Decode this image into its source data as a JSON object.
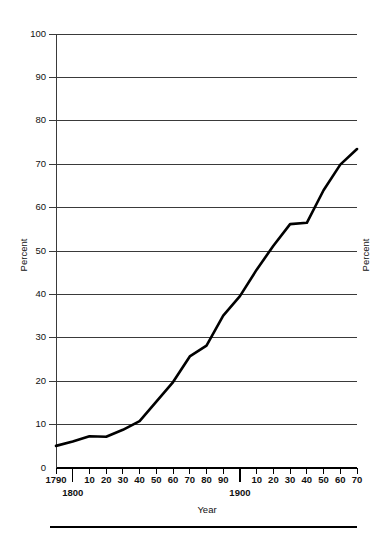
{
  "chart_data": {
    "type": "line",
    "title": "",
    "xlabel": "Year",
    "ylabel": "Percent",
    "ylabel_right": "Percent",
    "xlim": [
      1790,
      1970
    ],
    "ylim": [
      0,
      100
    ],
    "grid": true,
    "legend": "none",
    "y_ticks": [
      0,
      10,
      20,
      30,
      40,
      50,
      60,
      70,
      80,
      90,
      100
    ],
    "y_tick_labels": [
      "0",
      "10",
      "20",
      "30",
      "40",
      "50",
      "60",
      "70",
      "80",
      "90",
      "100"
    ],
    "x_ticks": [
      1790,
      1800,
      1810,
      1820,
      1830,
      1840,
      1850,
      1860,
      1870,
      1880,
      1890,
      1900,
      1910,
      1920,
      1930,
      1940,
      1950,
      1960,
      1970
    ],
    "x_tick_labels": [
      "1790",
      "1800",
      "10",
      "20",
      "30",
      "40",
      "50",
      "60",
      "70",
      "80",
      "90",
      "1900",
      "10",
      "20",
      "30",
      "40",
      "50",
      "60",
      "70"
    ],
    "x_major_ticks": [
      1800,
      1900
    ],
    "x_major_labels": [
      "1800",
      "1900"
    ],
    "x": [
      1790,
      1800,
      1810,
      1820,
      1830,
      1840,
      1850,
      1860,
      1870,
      1880,
      1890,
      1900,
      1910,
      1920,
      1930,
      1940,
      1950,
      1960,
      1970
    ],
    "values": [
      5.1,
      6.1,
      7.3,
      7.2,
      8.8,
      10.8,
      15.3,
      19.8,
      25.7,
      28.2,
      35.1,
      39.6,
      45.7,
      51.2,
      56.2,
      56.5,
      64.0,
      69.9,
      73.5
    ],
    "series": [
      {
        "name": "Percent urban",
        "values": [
          5.1,
          6.1,
          7.3,
          7.2,
          8.8,
          10.8,
          15.3,
          19.8,
          25.7,
          28.2,
          35.1,
          39.6,
          45.7,
          51.2,
          56.2,
          56.5,
          64.0,
          69.9,
          73.5
        ]
      }
    ],
    "annotations": []
  },
  "axes": {
    "left_title": "Percent",
    "right_title": "Percent",
    "bottom_title": "Year"
  }
}
